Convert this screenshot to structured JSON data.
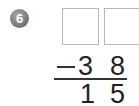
{
  "problem": {
    "number": "6",
    "answer_boxes": [
      "",
      ""
    ],
    "operator": "−",
    "subtrahend": [
      "3",
      "8"
    ],
    "difference": [
      "1",
      "5"
    ]
  }
}
